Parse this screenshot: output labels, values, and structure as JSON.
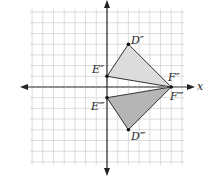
{
  "diagram": {
    "grid": {
      "xmin": -7,
      "xmax": 7,
      "ymin": -7,
      "ymax": 7,
      "cell_px": 10.7,
      "origin_px": [
        107,
        87
      ]
    },
    "axis_label_x": "x",
    "triangles": [
      {
        "name": "D''E''F''",
        "fill": "#d9d9d9",
        "points": [
          {
            "label": "D\"",
            "x": 2,
            "y": 4
          },
          {
            "label": "E\"",
            "x": 0,
            "y": 1
          },
          {
            "label": "F\"",
            "x": 6,
            "y": 0
          }
        ]
      },
      {
        "name": "D'''E'''F'''",
        "fill": "#b3b3b3",
        "points": [
          {
            "label": "D'\"",
            "x": 2,
            "y": -4
          },
          {
            "label": "E'\"",
            "x": 0,
            "y": -1
          },
          {
            "label": "F'\"",
            "x": 6,
            "y": 0
          }
        ]
      }
    ],
    "labels": {
      "D2": "D″",
      "E2": "E″",
      "F2": "F″",
      "D3": "D‴",
      "E3": "E‴",
      "F3": "F‴"
    },
    "reflection_line": "x-axis (dashed)"
  }
}
